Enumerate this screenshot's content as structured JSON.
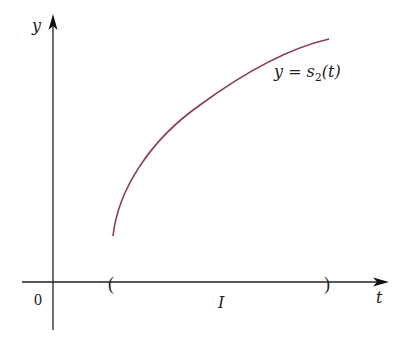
{
  "figure": {
    "y_axis_label": "y",
    "x_axis_label": "t",
    "origin_label": "0",
    "interval_label": "I",
    "interval_open_bracket": "(",
    "interval_close_bracket": ")",
    "curve_label_prefix": "y = s",
    "curve_label_subscript": "2",
    "curve_label_suffix": "(t)",
    "curve_color": "#8a3b4f",
    "axis_color": "#222222"
  }
}
